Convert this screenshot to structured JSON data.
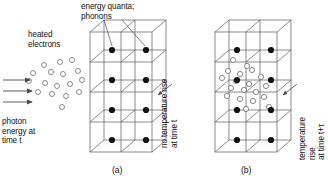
{
  "figure": {
    "title_caption_a": "(a)",
    "title_caption_b": "(b)",
    "labels": {
      "energy_quanta": "energy quanta;\nphonons",
      "heated_electrons": "heated\nelectrons",
      "photon_energy": "photon\nenergy at\ntime t",
      "no_temperature_rise": "no temperature rise\nat time t",
      "temperature_rise": "temperature rise\nat time t+τ"
    },
    "colors": {
      "line": "#4a4a4a",
      "lattice_line": "#5a5a5a",
      "atom_fill": "#111111",
      "phonon_stroke": "#5a5a5a",
      "phonon_fill": "#ffffff",
      "text": "#141414",
      "background": "#ffffff"
    },
    "panels": [
      {
        "id": "a",
        "caption": "(a)",
        "description": "cubic lattice with filled atoms, no phonons",
        "lattice": {
          "rows": 4,
          "cols": 2,
          "depth": 1,
          "atom_count": 8,
          "phonon_count": 0
        },
        "electron_cloud": {
          "visible": true,
          "circle_count": 17
        },
        "photon_arrows": 3,
        "leader_lines": 2,
        "pointer_arrows": 1
      },
      {
        "id": "b",
        "caption": "(b)",
        "description": "same lattice, phonon quanta emitted in interior",
        "lattice": {
          "rows": 4,
          "cols": 2,
          "depth": 1,
          "atom_count": 8,
          "phonon_count": 19
        },
        "electron_cloud": {
          "visible": false,
          "circle_count": 0
        },
        "photon_arrows": 0,
        "leader_lines": 0,
        "pointer_arrows": 1
      }
    ],
    "geometry": {
      "panel_a": {
        "x": 90,
        "y": 32,
        "w": 62,
        "h": 120,
        "dx": 14,
        "dy": -12
      },
      "panel_b": {
        "x": 215,
        "y": 32,
        "w": 62,
        "h": 120,
        "dx": 14,
        "dy": -12
      },
      "atom_radius": 3.1,
      "phonon_radius": 2.6,
      "electron_radius": 2.5
    },
    "electron_cloud_points": [
      [
        44,
        65
      ],
      [
        60,
        62
      ],
      [
        72,
        60
      ],
      [
        33,
        73
      ],
      [
        51,
        72
      ],
      [
        63,
        74
      ],
      [
        78,
        71
      ],
      [
        29,
        81
      ],
      [
        45,
        83
      ],
      [
        57,
        86
      ],
      [
        70,
        84
      ],
      [
        82,
        80
      ],
      [
        38,
        92
      ],
      [
        52,
        94
      ],
      [
        66,
        96
      ],
      [
        79,
        92
      ],
      [
        62,
        107
      ]
    ],
    "photon_arrow_rows": [
      {
        "x1": 3,
        "x2": 30,
        "y": 80
      },
      {
        "x1": 3,
        "x2": 32,
        "y": 91
      },
      {
        "x1": 3,
        "x2": 32,
        "y": 102
      }
    ],
    "phonon_points_b": [
      [
        233,
        60
      ],
      [
        247,
        66
      ],
      [
        228,
        71
      ],
      [
        240,
        74
      ],
      [
        252,
        70
      ],
      [
        222,
        78
      ],
      [
        236,
        81
      ],
      [
        249,
        84
      ],
      [
        261,
        77
      ],
      [
        231,
        88
      ],
      [
        244,
        90
      ],
      [
        256,
        92
      ],
      [
        266,
        86
      ],
      [
        227,
        96
      ],
      [
        240,
        99
      ],
      [
        253,
        101
      ],
      [
        264,
        97
      ],
      [
        269,
        107
      ],
      [
        246,
        109
      ]
    ]
  }
}
